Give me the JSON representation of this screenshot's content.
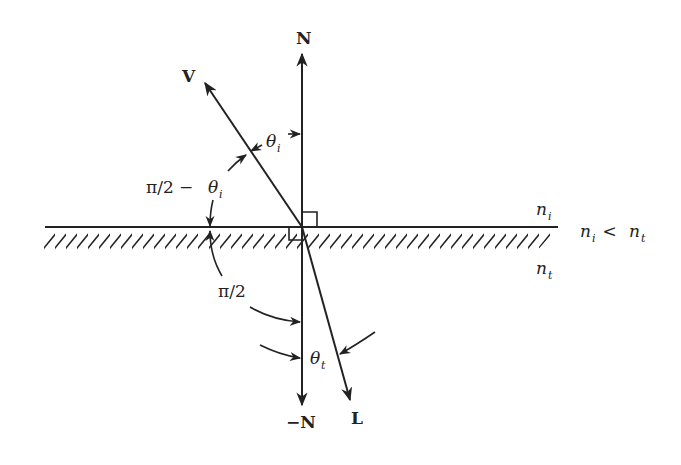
{
  "diagram": {
    "type": "refraction-geometry",
    "vectors": {
      "normal": {
        "label": "N"
      },
      "negative_normal": {
        "label": "−N"
      },
      "view": {
        "label": "V"
      },
      "refracted": {
        "label": "L"
      }
    },
    "angles": {
      "incident": {
        "symbol": "θ",
        "sub": "i"
      },
      "complement": {
        "prefix": "π/2 − ",
        "symbol": "θ",
        "sub": "i"
      },
      "right": {
        "label": "π/2"
      },
      "transmitted": {
        "symbol": "θ",
        "sub": "t"
      }
    },
    "media": {
      "upper": {
        "symbol": "n",
        "sub": "i"
      },
      "lower": {
        "symbol": "n",
        "sub": "t"
      },
      "relation": {
        "left": "n",
        "left_sub": "i",
        "op": " < ",
        "right": "n",
        "right_sub": "t"
      }
    },
    "colors": {
      "ink": "#222222",
      "background": "#ffffff"
    }
  }
}
